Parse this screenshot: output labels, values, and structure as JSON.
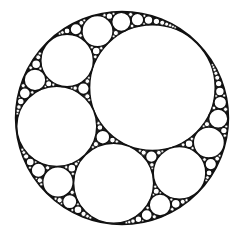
{
  "figure": {
    "width": 239,
    "height": 243,
    "background": "#ffffff",
    "stroke": "#111111",
    "outer_stroke_width": 2.4,
    "inner_stroke_width": 1.5,
    "min_radius": 1.1,
    "outer_circle": {
      "cx": 122,
      "cy": 118,
      "r": 106
    },
    "seed_circles": [
      {
        "name": "large-circle",
        "r": 63,
        "angle_deg": -45
      },
      {
        "name": "left-circle"
      },
      {
        "name": "bottom-circle"
      }
    ]
  }
}
